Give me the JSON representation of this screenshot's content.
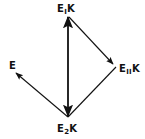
{
  "diagram": {
    "type": "vector-diagram",
    "stroke_color": "#111111",
    "background_color": "#ffffff",
    "nodes": {
      "top": {
        "base": "E",
        "sub": "I",
        "suffix": "K"
      },
      "bottom": {
        "base": "E",
        "sub": "2",
        "suffix": "K"
      },
      "right": {
        "base": "E",
        "sub": "II",
        "suffix": "K"
      },
      "left": {
        "base": "E",
        "sub": "",
        "suffix": ""
      }
    },
    "edges": [
      {
        "from": "bottom",
        "to": "top",
        "arrow": "both"
      },
      {
        "from": "top",
        "to": "right",
        "arrow": "end"
      },
      {
        "from": "right",
        "to": "bottom",
        "arrow": "none"
      },
      {
        "from": "bottom",
        "to": "left",
        "arrow": "end"
      }
    ]
  }
}
